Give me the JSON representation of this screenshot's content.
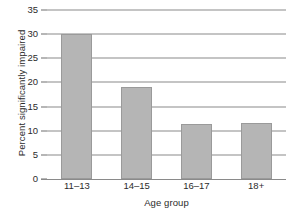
{
  "chart_data": {
    "type": "bar",
    "title": "",
    "subtitle": "",
    "xlabel": "Age group",
    "ylabel": "Percent significantly impaired",
    "categories": [
      "11–13",
      "14–15",
      "16–17",
      "18+"
    ],
    "values": [
      30.1,
      19.0,
      11.4,
      11.7
    ],
    "series": [
      {
        "name": "Percent significantly impaired",
        "values": [
          30.1,
          19.0,
          11.4,
          11.7
        ]
      }
    ],
    "ylim": [
      0,
      35
    ],
    "yticks": [
      0,
      5,
      10,
      15,
      20,
      25,
      30,
      35
    ],
    "ytick_labels": [
      "0",
      "5",
      "10",
      "15",
      "20",
      "25",
      "30",
      "35"
    ],
    "xlim_categories": 4,
    "grid": "horizontal",
    "legend": "none",
    "annotations": [],
    "colors": {
      "bar_fill": "#b5b5b5",
      "bar_stroke": "#9a9a9a",
      "gridline": "#8a8a8a",
      "axis": "#8a8a8a",
      "tick_mark": "#6e6e6e",
      "text": "#2b2b2b",
      "background": "#ffffff"
    }
  }
}
